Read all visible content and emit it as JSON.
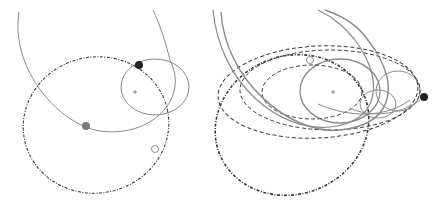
{
  "figure": {
    "width": 440,
    "height": 202,
    "background": "#ffffff",
    "colors": {
      "solid_orbit": "#8a8a8a",
      "dashed_orbit": "#3a3a3a",
      "dark_body": "#222222",
      "gray_body": "#7a7a7a",
      "hollow_body_stroke": "#8a8a8a",
      "center_mark": "#777777"
    }
  },
  "panels": [
    {
      "id": "left",
      "center_mark": {
        "x": 135,
        "y": 92
      },
      "orbits": [
        {
          "kind": "ellipse",
          "style": "solid",
          "cx": 155,
          "cy": 87,
          "rx": 34,
          "ry": 28,
          "rot": 0,
          "width": 1
        },
        {
          "kind": "path",
          "style": "solid",
          "d": "M 19 12 C 10 70, 60 125, 100 131 C 150 138, 190 100, 170 60 C 165 40, 160 25, 153 10",
          "width": 1
        },
        {
          "kind": "ellipse",
          "style": "dashdot",
          "cx": 96,
          "cy": 125,
          "rx": 73,
          "ry": 68,
          "rot": -12,
          "width": 1.1
        }
      ],
      "bodies": [
        {
          "type": "dark",
          "x": 139,
          "y": 65,
          "r": 4
        },
        {
          "type": "gray",
          "x": 86,
          "y": 126,
          "r": 4
        },
        {
          "type": "hollow",
          "x": 155,
          "y": 149,
          "r": 3.5
        }
      ]
    },
    {
      "id": "right",
      "center_mark": {
        "x": 333,
        "y": 92
      },
      "orbits": [
        {
          "kind": "ellipse",
          "style": "solid",
          "cx": 340,
          "cy": 91,
          "rx": 40,
          "ry": 32,
          "rot": 0,
          "width": 1.3
        },
        {
          "kind": "ellipse",
          "style": "solid",
          "cx": 398,
          "cy": 91,
          "rx": 22,
          "ry": 20,
          "rot": 0,
          "width": 1
        },
        {
          "kind": "ellipse",
          "style": "solid",
          "cx": 378,
          "cy": 104,
          "rx": 18,
          "ry": 14,
          "rot": 0,
          "width": 1
        },
        {
          "kind": "ellipse",
          "style": "dashed",
          "cx": 312,
          "cy": 92,
          "rx": 50,
          "ry": 27,
          "rot": 0,
          "width": 1
        },
        {
          "kind": "ellipse",
          "style": "dashed",
          "cx": 330,
          "cy": 90,
          "rx": 90,
          "ry": 40,
          "rot": 0,
          "width": 1
        },
        {
          "kind": "ellipse",
          "style": "dashed",
          "cx": 318,
          "cy": 92,
          "rx": 100,
          "ry": 46,
          "rot": -3,
          "width": 1
        },
        {
          "kind": "ellipse",
          "style": "dashdot",
          "cx": 292,
          "cy": 125,
          "rx": 78,
          "ry": 69,
          "rot": -22,
          "width": 1.6
        },
        {
          "kind": "path",
          "style": "solid",
          "d": "M 221 12 C 225 80, 290 135, 340 130 C 390 125, 400 90, 375 50 C 365 35, 355 20, 325 10",
          "width": 1.4
        },
        {
          "kind": "path",
          "style": "solid",
          "d": "M 213 10 C 220 85, 280 132, 330 127 C 380 122, 385 80, 355 40 C 345 28, 335 18, 318 10",
          "width": 1.2
        },
        {
          "kind": "path",
          "style": "solid",
          "d": "M 350 108 C 370 118, 400 115, 420 100",
          "width": 1
        },
        {
          "kind": "path",
          "style": "solid",
          "d": "M 318 104 C 350 118, 385 118, 410 100",
          "width": 1
        }
      ],
      "bodies": [
        {
          "type": "dark",
          "x": 424,
          "y": 97,
          "r": 4
        },
        {
          "type": "hollow",
          "x": 310,
          "y": 60,
          "r": 3.5
        }
      ]
    }
  ]
}
